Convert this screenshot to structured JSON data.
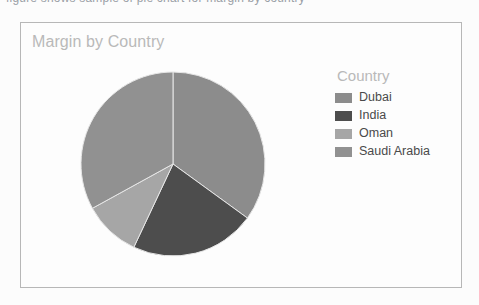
{
  "document": {
    "clipped_top_text": "figure shows sample of pie chart for margin by country"
  },
  "card": {
    "title": "Margin by Country"
  },
  "legend": {
    "title": "Country",
    "items": [
      {
        "label": "Dubai",
        "color": "#8c8c8c"
      },
      {
        "label": "India",
        "color": "#4d4d4d"
      },
      {
        "label": "Oman",
        "color": "#a6a6a6"
      },
      {
        "label": "Saudi Arabia",
        "color": "#919191"
      }
    ]
  },
  "chart_data": {
    "type": "pie",
    "title": "Margin by Country",
    "legend_title": "Country",
    "legend_position": "right",
    "categories": [
      "Dubai",
      "India",
      "Oman",
      "Saudi Arabia"
    ],
    "values": [
      35,
      22,
      10,
      33
    ],
    "unit": "percent",
    "colors": [
      "#8c8c8c",
      "#4d4d4d",
      "#a6a6a6",
      "#919191"
    ],
    "start_angle_deg": 0,
    "direction": "clockwise",
    "grid": false,
    "data_labels": false,
    "center_px": [
      172,
      163
    ],
    "radius_px": 92
  }
}
